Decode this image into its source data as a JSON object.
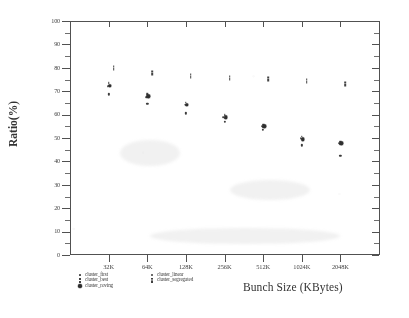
{
  "chart_data": {
    "type": "scatter",
    "title": "",
    "xlabel": "Bunch Size (KBytes)",
    "ylabel": "Ratio(%)",
    "categories": [
      "32K",
      "64K",
      "128K",
      "256K",
      "512K",
      "1024K",
      "2048K"
    ],
    "ylim": [
      0,
      100
    ],
    "ytick_step": 10,
    "yticks": [
      "0",
      "10",
      "20",
      "30",
      "40",
      "50",
      "60",
      "70",
      "80",
      "90",
      "100"
    ],
    "minor_ytick_step": 5,
    "grid": false,
    "legend_position": "bottom-left",
    "series": [
      {
        "name": "cluster_first",
        "marker": "dot",
        "values": [
          72.3,
          67.5,
          64.3,
          58.8,
          55.0,
          49.8,
          47.8
        ]
      },
      {
        "name": "cluster_best",
        "marker": "colon",
        "values": [
          73.0,
          68.3,
          64.6,
          59.2,
          55.3,
          50.2,
          48.0
        ]
      },
      {
        "name": "cluster_roving",
        "marker": "star",
        "values": [
          72.2,
          67.8,
          64.2,
          58.9,
          55.0,
          49.5,
          47.7
        ]
      },
      {
        "name": "cluster_linear",
        "marker": "sq",
        "values": [
          68.6,
          64.6,
          60.5,
          57.0,
          53.6,
          46.8,
          42.4
        ]
      },
      {
        "name": "cluster_segregated",
        "marker": "bar",
        "values": [
          80.0,
          77.8,
          76.6,
          75.7,
          75.1,
          74.2,
          73.2
        ]
      }
    ]
  },
  "legend": {
    "column_left": [
      "cluster_first",
      "cluster_best",
      "cluster_roving"
    ],
    "column_right": [
      "cluster_linear",
      "cluster_segregated"
    ]
  },
  "colors": {
    "axis": "#4a4a4a",
    "marker": "#333333",
    "text": "#2b2b2b",
    "background": "#ffffff"
  }
}
